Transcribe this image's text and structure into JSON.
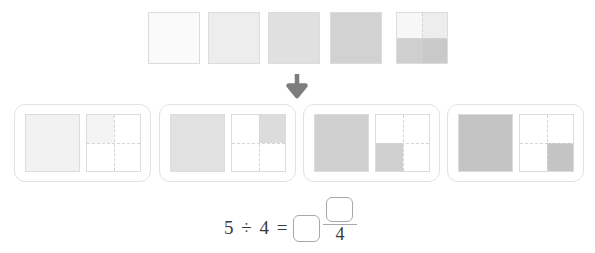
{
  "worksheet": {
    "title": "5 divided by 4 area model",
    "arrow_icon": "down-arrow-icon"
  },
  "colors": {
    "shade_0": "#fafafa",
    "shade_1": "#ededed",
    "shade_2": "#e0e0e0",
    "shade_3": "#d4d4d4",
    "shade_4": "#c6c6c6",
    "square_border": "#dcdcdc",
    "group_border": "#e2e2e2",
    "dash_line": "#d5d5d5",
    "arrow": "#7d7d7d",
    "text": "#3b3b3b",
    "box_border": "#a8a8a8",
    "white": "#ffffff"
  },
  "top_row": {
    "label": "five whole squares",
    "squares": [
      {
        "name": "whole-square-1",
        "type": "solid",
        "fill": "#fafafa",
        "left": 148
      },
      {
        "name": "whole-square-2",
        "type": "solid",
        "fill": "#ededed",
        "left": 208
      },
      {
        "name": "whole-square-3",
        "type": "solid",
        "fill": "#e0e0e0",
        "left": 268
      },
      {
        "name": "whole-square-4",
        "type": "solid",
        "fill": "#d2d2d2",
        "left": 330
      },
      {
        "name": "whole-square-5",
        "type": "quartered",
        "left": 396,
        "quadrants": {
          "top_left": "#f7f7f7",
          "top_right": "#ededed",
          "bottom_left": "#cfcfcf",
          "bottom_right": "#c9c9c9"
        }
      }
    ]
  },
  "groups": [
    {
      "name": "share-group-1",
      "left": 14,
      "whole_fill": "#f2f2f2",
      "part_shaded_quadrant": "top_left",
      "part_fill": "#f4f4f4"
    },
    {
      "name": "share-group-2",
      "left": 159,
      "whole_fill": "#e1e1e1",
      "part_shaded_quadrant": "top_right",
      "part_fill": "#dcdcdc"
    },
    {
      "name": "share-group-3",
      "left": 303,
      "whole_fill": "#d0d0d0",
      "part_shaded_quadrant": "bottom_left",
      "part_fill": "#cfcfcf"
    },
    {
      "name": "share-group-4",
      "left": 447,
      "whole_fill": "#c3c3c3",
      "part_shaded_quadrant": "bottom_right",
      "part_fill": "#c4c4c4"
    }
  ],
  "equation": {
    "lhs": "5 ÷ 4 =",
    "dividend": "5",
    "divisor": "4",
    "whole_answer": "",
    "numerator_answer": "",
    "denominator": "4"
  }
}
